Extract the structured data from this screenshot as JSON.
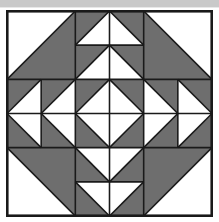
{
  "figure": {
    "kind": "geometric-quilt-block",
    "canvas": {
      "width": 219,
      "height": 222
    },
    "background": "#ffffff"
  },
  "palette": {
    "fabric_dark": "#6e6e6e",
    "fabric_light": "#ffffff",
    "seam_line": "#1a1a1a",
    "page_background": "#ffffff",
    "top_strip": "#c9c9c9"
  },
  "block": {
    "x": 6,
    "y": 10,
    "size": 207,
    "border_color": "#1a1a1a",
    "border_width": 1,
    "grid_rows": 3,
    "grid_cols": 3,
    "unit_size": 69,
    "subunit_size": 34.5,
    "description": "Nine units arranged 3x3. Each unit is built from four half-square-triangle subunits."
  },
  "units": [
    {
      "name": "top-left-corner",
      "row": 0,
      "col": 0,
      "pattern": "large-half-square-triangle",
      "dark_side": "lower-right"
    },
    {
      "name": "top-center",
      "row": 0,
      "col": 1,
      "pattern": "flying-geese-pair-up",
      "dark_side": "background"
    },
    {
      "name": "top-right-corner",
      "row": 0,
      "col": 2,
      "pattern": "large-half-square-triangle",
      "dark_side": "lower-left"
    },
    {
      "name": "middle-left",
      "row": 1,
      "col": 0,
      "pattern": "triangles-pointing-left",
      "dark_side": "background"
    },
    {
      "name": "center",
      "row": 1,
      "col": 1,
      "pattern": "square-in-a-square-diamond",
      "dark_side": "corners"
    },
    {
      "name": "middle-right",
      "row": 1,
      "col": 2,
      "pattern": "triangles-pointing-right",
      "dark_side": "background"
    },
    {
      "name": "bottom-left-corner",
      "row": 2,
      "col": 0,
      "pattern": "large-half-square-triangle",
      "dark_side": "upper-right"
    },
    {
      "name": "bottom-center",
      "row": 2,
      "col": 1,
      "pattern": "flying-geese-pair-down",
      "dark_side": "background"
    },
    {
      "name": "bottom-right-corner",
      "row": 2,
      "col": 2,
      "pattern": "large-half-square-triangle",
      "dark_side": "upper-left"
    }
  ],
  "geometry": {
    "dark_polygons": [
      "0,0 69,0 69,69 0,69 :: tl-corner-dark = 0,69 69,0 69,69",
      "top-center background rectangle 69,0 138,69 minus 4 light triangles",
      "tr-corner-dark = 138,0 207,0 138,69",
      "middle-left background 0,69 69,138 minus 4 light left-pointing triangles",
      "center corners around white diamond 69,69 138,138",
      "middle-right background 138,69 207,138 minus 4 light right-pointing triangles",
      "bl-corner-dark = 0,138 69,207 0,207 reversed",
      "bottom-center background 69,138 138,207 minus 4 light triangles",
      "br-corner-dark = 138,207 207,138 207,207 reversed"
    ],
    "note": "Coordinates are expressed in the 207x207 block space."
  }
}
